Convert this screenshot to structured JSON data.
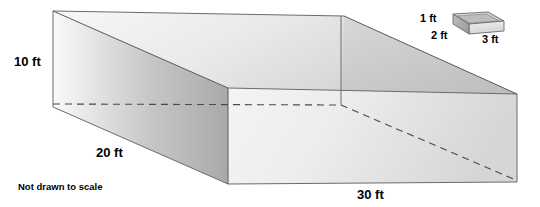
{
  "figure": {
    "note": "Not drawn to scale",
    "background_color": "#ffffff",
    "stroke_color": "#595959",
    "text_color": "#000000"
  },
  "main_prism": {
    "name": "large-open-box",
    "labels": {
      "height": "10 ft",
      "width": "20 ft",
      "length": "30 ft"
    },
    "dimensions": {
      "height_ft": 10,
      "width_ft": 20,
      "length_ft": 30
    },
    "face_colors": {
      "top_inside": "#f2f2f2",
      "left_outside": "#c9c9c9",
      "front_outside": "#efefef",
      "right_wall": "#b8b8b8",
      "back_inside": "#e6e6e6"
    }
  },
  "small_prism": {
    "name": "small-open-box",
    "labels": {
      "height": "1 ft",
      "width": "2 ft",
      "length": "3 ft"
    },
    "dimensions": {
      "height_ft": 1,
      "width_ft": 2,
      "length_ft": 3
    },
    "face_colors": {
      "top_inside": "#dcdcdc",
      "front": "#e8e8e8",
      "side": "#b5b5b5"
    }
  }
}
